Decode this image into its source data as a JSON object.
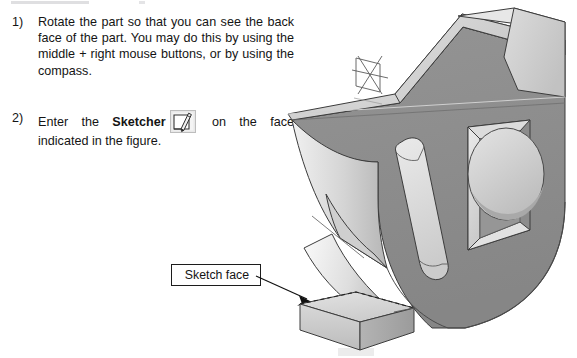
{
  "page": {
    "background": "#ffffff",
    "width": 577,
    "height": 358
  },
  "instructions": {
    "steps": [
      {
        "marker": "1)",
        "text_before": "Rotate the part so that you can see the back face of the part.  You may do this by using the middle + right mouse buttons, or by using the compass.",
        "bold_term": "",
        "text_after": "",
        "has_icon": false
      },
      {
        "marker": "2)",
        "text_before": "Enter the ",
        "bold_term": "Sketcher",
        "text_after": " on the face indicated in the figure.",
        "has_icon": true,
        "icon_name": "sketcher-icon"
      }
    ]
  },
  "callout": {
    "label": "Sketch face",
    "border_color": "#1c1c1c",
    "fill_color": "#ffffff"
  },
  "figure": {
    "name": "cad-part-isometric",
    "colors": {
      "front_face": "#8c8c8c",
      "top_face": "#e0e0e0",
      "upper_slope": "#d2d2d2",
      "side_face": "#a8a8a8",
      "pocket_wall": "#dcdcdc",
      "pocket_floor": "#9a9a9a",
      "fillet_light": "#d8d8d8",
      "outline": "#3a3a3a"
    },
    "features": [
      "angled upper arm",
      "concave fillet on left",
      "elongated rounded slot",
      "rectangular pocket",
      "circular boss",
      "axis-system marker",
      "bottom base block"
    ],
    "axis_marker_name": "axis-system-icon"
  },
  "arrow": {
    "name": "callout-arrow",
    "color": "#111111",
    "points_to": "sketch face on bottom base block"
  }
}
